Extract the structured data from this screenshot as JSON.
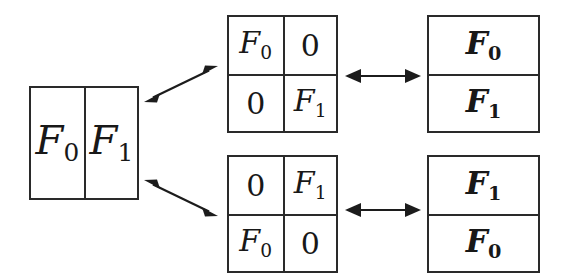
{
  "figure": {
    "stroke_color": "#2a2a2a",
    "text_color": "#181818",
    "background": "#ffffff"
  },
  "boxes": {
    "left": {
      "name": "direct-sum-box",
      "layout": "1x2",
      "cells": [
        {
          "symbol": "F",
          "subscript": "0",
          "bold": false
        },
        {
          "symbol": "F",
          "subscript": "1",
          "bold": false
        }
      ]
    },
    "matrix_top": {
      "name": "diagonal-matrix",
      "layout": "2x2",
      "cells": [
        {
          "symbol": "F",
          "subscript": "0",
          "bold": false
        },
        {
          "symbol": "0",
          "subscript": "",
          "bold": false
        },
        {
          "symbol": "0",
          "subscript": "",
          "bold": false
        },
        {
          "symbol": "F",
          "subscript": "1",
          "bold": false
        }
      ]
    },
    "matrix_bottom": {
      "name": "antidiagonal-matrix",
      "layout": "2x2",
      "cells": [
        {
          "symbol": "0",
          "subscript": "",
          "bold": false
        },
        {
          "symbol": "F",
          "subscript": "1",
          "bold": false
        },
        {
          "symbol": "F",
          "subscript": "0",
          "bold": false
        },
        {
          "symbol": "0",
          "subscript": "",
          "bold": false
        }
      ]
    },
    "vector_top": {
      "name": "column-vector-f0-f1",
      "layout": "2x1",
      "cells": [
        {
          "symbol": "F",
          "subscript": "0",
          "bold": true
        },
        {
          "symbol": "F",
          "subscript": "1",
          "bold": true
        }
      ]
    },
    "vector_bottom": {
      "name": "column-vector-f1-f0",
      "layout": "2x1",
      "cells": [
        {
          "symbol": "F",
          "subscript": "1",
          "bold": true
        },
        {
          "symbol": "F",
          "subscript": "0",
          "bold": true
        }
      ]
    }
  },
  "arrows": [
    {
      "name": "arrow-left-to-diagonal-matrix",
      "style": "double-headed",
      "orientation": "diagonal-up-right"
    },
    {
      "name": "arrow-left-to-antidiagonal-matrix",
      "style": "double-headed",
      "orientation": "diagonal-down-right"
    },
    {
      "name": "arrow-diagonal-matrix-to-vector",
      "style": "double-headed",
      "orientation": "horizontal"
    },
    {
      "name": "arrow-antidiagonal-matrix-to-vector",
      "style": "double-headed",
      "orientation": "horizontal"
    }
  ]
}
